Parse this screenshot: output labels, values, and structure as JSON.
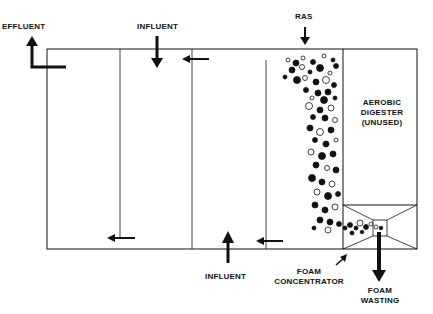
{
  "labels": {
    "effluent": "EFFLUENT",
    "influent_top": "INFLUENT",
    "ras": "RAS",
    "digester_line1": "AEROBIC",
    "digester_line2": "DIGESTER",
    "digester_line3": "(UNUSED)",
    "influent_bottom": "INFLUENT",
    "foam_concentrator_line1": "FOAM",
    "foam_concentrator_line2": "CONCENTRATOR",
    "foam_wasting_line1": "FOAM",
    "foam_wasting_line2": "WASTING"
  },
  "colors": {
    "line": "#111111",
    "background": "#ffffff"
  }
}
